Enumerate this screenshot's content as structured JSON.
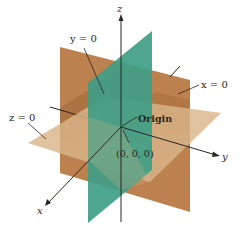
{
  "diagram": {
    "colors": {
      "x_plane": "#b87a45",
      "x_plane_shade": "#a0683a",
      "y_plane": "#3f9e86",
      "z_plane": "#d9b58a",
      "axis": "#2a2622",
      "background": "#ffffff"
    },
    "axes": {
      "x_label": "x",
      "y_label": "y",
      "z_label": "z"
    },
    "planes": [
      {
        "name": "x-plane",
        "label": "x = 0"
      },
      {
        "name": "y-plane",
        "label": "y = 0"
      },
      {
        "name": "z-plane",
        "label": "z = 0"
      }
    ],
    "origin": {
      "label": "Origin",
      "coords_label": "(0, 0, 0)"
    }
  }
}
